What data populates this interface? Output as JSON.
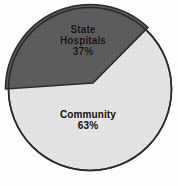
{
  "chart_data": {
    "type": "pie",
    "title": "",
    "subtitle": "",
    "xlabel": "",
    "ylabel": "",
    "legend_position": "none",
    "grid": false,
    "categories": [
      "State Hospitals",
      "Community"
    ],
    "values": [
      37,
      63
    ],
    "value_unit": "%",
    "slices": [
      {
        "label": "State Hospitals",
        "label_line_1": "State",
        "label_line_2": "Hospitals",
        "value": 37,
        "value_label": "37%",
        "color": "#5c5c5c",
        "text_color": "#0d0d0d"
      },
      {
        "label": "Community",
        "label_line_1": "Community",
        "label_line_2": "",
        "value": 63,
        "value_label": "63%",
        "color": "#e3e3e3",
        "text_color": "#0d0d0d"
      }
    ]
  },
  "figure": {
    "background_color": "#fefefe",
    "outline_color": "#2b2b2b"
  }
}
